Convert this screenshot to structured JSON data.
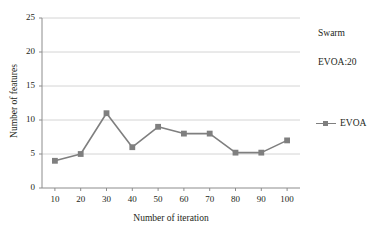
{
  "chart_data": {
    "type": "line",
    "title": "",
    "xlabel": "Number of iteration",
    "ylabel": "Number of features",
    "x": [
      10,
      20,
      30,
      40,
      50,
      60,
      70,
      80,
      90,
      100
    ],
    "xticklabels": [
      "10",
      "20",
      "30",
      "40",
      "50",
      "60",
      "70",
      "80",
      "90",
      "100"
    ],
    "yticklabels": [
      "0",
      "5",
      "10",
      "15",
      "20",
      "25"
    ],
    "yticks": [
      0,
      5,
      10,
      15,
      20,
      25
    ],
    "xlim": [
      5,
      105
    ],
    "ylim": [
      0,
      25
    ],
    "grid": "horizontal",
    "legend_position": "right",
    "series": [
      {
        "name": "EVOA",
        "color": "#7f7f7f",
        "marker": "square",
        "values": [
          4,
          5,
          11,
          6,
          9,
          8,
          8,
          5.2,
          5.2,
          7
        ]
      }
    ],
    "annotations": [
      {
        "text": "Swarm"
      },
      {
        "text": "EVOA:20"
      }
    ]
  },
  "axes": {
    "y_title": "Number of features",
    "x_title": "Number of iteration"
  },
  "legend": {
    "label": "EVOA"
  },
  "notes": {
    "swarm": "Swarm",
    "evoa": "EVOA:20"
  }
}
